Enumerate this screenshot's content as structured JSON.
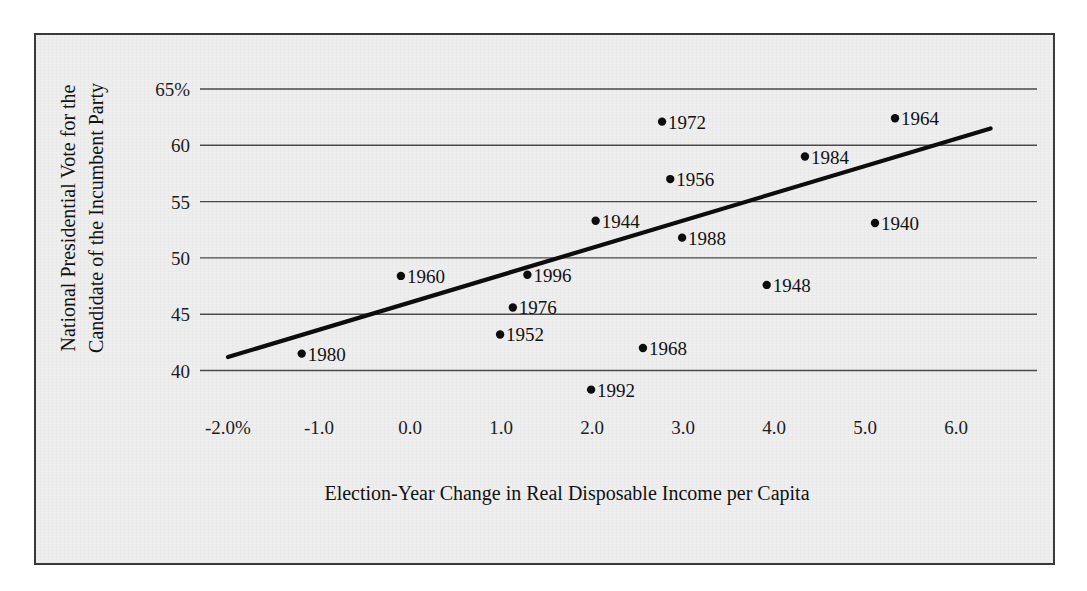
{
  "chart_data": {
    "type": "scatter",
    "title": "",
    "xlabel": "Election-Year Change in Real Disposable Income per Capita",
    "ylabel_line1": "National Presidential Vote for the",
    "ylabel_line2": "Candidate of the Incumbent Party",
    "xlim": [
      -2.55,
      6.9
    ],
    "ylim": [
      36.5,
      66.5
    ],
    "grid": true,
    "legend": "none",
    "xticks": [
      "-2.0%",
      "-1.0",
      "0.0",
      "1.0",
      "2.0",
      "3.0",
      "4.0",
      "5.0",
      "6.0"
    ],
    "xtick_values": [
      -2.0,
      -1.0,
      0.0,
      1.0,
      2.0,
      3.0,
      4.0,
      5.0,
      6.0
    ],
    "yticks": [
      "65%",
      "60",
      "55",
      "50",
      "45",
      "40"
    ],
    "ytick_values": [
      65,
      60,
      55,
      50,
      45,
      40
    ],
    "point_label_field": "label",
    "points": [
      {
        "label": "1980",
        "x": -1.19,
        "y": 41.5
      },
      {
        "label": "1960",
        "x": -0.1,
        "y": 48.4
      },
      {
        "label": "1952",
        "x": 0.99,
        "y": 43.2
      },
      {
        "label": "1976",
        "x": 1.13,
        "y": 45.6
      },
      {
        "label": "1996",
        "x": 1.29,
        "y": 48.5
      },
      {
        "label": "1992",
        "x": 1.99,
        "y": 38.3
      },
      {
        "label": "1944",
        "x": 2.04,
        "y": 53.3
      },
      {
        "label": "1968",
        "x": 2.56,
        "y": 42.0
      },
      {
        "label": "1972",
        "x": 2.77,
        "y": 62.1
      },
      {
        "label": "1956",
        "x": 2.86,
        "y": 57.0
      },
      {
        "label": "1988",
        "x": 2.99,
        "y": 51.8
      },
      {
        "label": "1948",
        "x": 3.92,
        "y": 47.6
      },
      {
        "label": "1984",
        "x": 4.34,
        "y": 59.0
      },
      {
        "label": "1940",
        "x": 5.11,
        "y": 53.1
      },
      {
        "label": "1964",
        "x": 5.33,
        "y": 62.4
      }
    ],
    "trendline": {
      "name": "regression-line",
      "x_start": -2.0,
      "y_start": 41.2,
      "x_end": 6.38,
      "y_end": 61.5
    },
    "colors": {
      "ink": "#0d0d0d",
      "gridline": "#4a4a4a",
      "plate_background": "#eeeeee",
      "plate_border": "#3a3a3a",
      "page_background": "#ffffff"
    }
  }
}
